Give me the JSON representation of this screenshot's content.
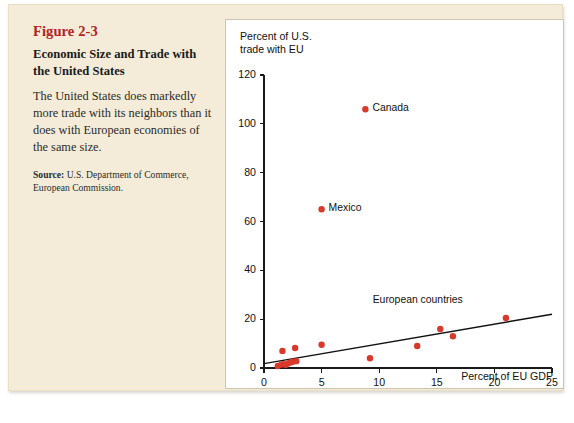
{
  "figure": {
    "number": "Figure 2-3",
    "title": "Economic Size and Trade with the United States",
    "body": "The United States does markedly more trade with its neighbors than it does with European economies of the same size.",
    "source_label": "Source:",
    "source_text": " U.S. Department of Commerce, European Commission."
  },
  "colors": {
    "page_background": "#f4ecd8",
    "panel_background": "#ffffff",
    "figure_number": "#b22222",
    "marker": "#d8392b",
    "axis": "#1a1a1a",
    "trendline": "#111111"
  },
  "chart_data": {
    "type": "scatter",
    "title": "",
    "xlabel": "Percent of EU GDP",
    "ylabel": "Percent of U.S. trade with EU",
    "ylabel_lines": [
      "Percent of U.S.",
      "trade with EU"
    ],
    "xlim": [
      0,
      25
    ],
    "ylim": [
      0,
      120
    ],
    "xticks": [
      0,
      5,
      10,
      15,
      20,
      25
    ],
    "yticks": [
      0,
      20,
      40,
      60,
      80,
      100,
      120
    ],
    "grid": false,
    "legend": null,
    "annotations": [
      {
        "text": "European countries",
        "x": 13.6,
        "y": 27.5
      }
    ],
    "trendline": {
      "x": [
        0,
        25
      ],
      "y": [
        1.8,
        22.0
      ]
    },
    "points": [
      {
        "x": 8.8,
        "y": 106.0,
        "label": "Canada"
      },
      {
        "x": 5.0,
        "y": 65.0,
        "label": "Mexico"
      },
      {
        "x": 1.6,
        "y": 7.0,
        "label": ""
      },
      {
        "x": 2.7,
        "y": 8.2,
        "label": ""
      },
      {
        "x": 5.0,
        "y": 9.5,
        "label": ""
      },
      {
        "x": 1.5,
        "y": 1.4,
        "label": ""
      },
      {
        "x": 1.7,
        "y": 1.6,
        "label": ""
      },
      {
        "x": 1.9,
        "y": 1.3,
        "label": ""
      },
      {
        "x": 2.1,
        "y": 1.9,
        "label": ""
      },
      {
        "x": 2.3,
        "y": 2.3,
        "label": ""
      },
      {
        "x": 2.5,
        "y": 2.6,
        "label": ""
      },
      {
        "x": 2.8,
        "y": 2.8,
        "label": ""
      },
      {
        "x": 1.2,
        "y": 0.8,
        "label": ""
      },
      {
        "x": 9.2,
        "y": 4.0,
        "label": ""
      },
      {
        "x": 13.3,
        "y": 9.0,
        "label": ""
      },
      {
        "x": 15.3,
        "y": 16.0,
        "label": ""
      },
      {
        "x": 16.4,
        "y": 13.0,
        "label": ""
      },
      {
        "x": 21.0,
        "y": 20.5,
        "label": ""
      }
    ]
  }
}
